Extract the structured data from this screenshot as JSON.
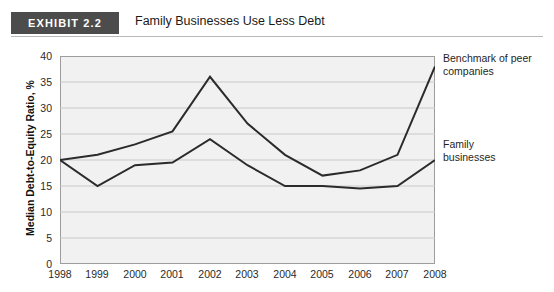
{
  "header": {
    "badge": "EXHIBIT 2.2",
    "title": "Family Businesses Use Less Debt"
  },
  "colors": {
    "badge_background": "#4c4c4c",
    "plot_background": "#f1f1f1",
    "gridline": "#c9c9c9",
    "axis": "#9c9c9c",
    "benchmark_line": "#2b2b2b",
    "family_line": "#2b2b2b"
  },
  "chart_data": {
    "type": "line",
    "title": "Family Businesses Use Less Debt",
    "xlabel": "",
    "ylabel": "Median Debt-to-Equity Ratio, %",
    "x": [
      1998,
      1999,
      2000,
      2001,
      2002,
      2003,
      2004,
      2005,
      2006,
      2007,
      2008
    ],
    "xtick_labels": [
      "1998",
      "1999",
      "2000",
      "2001",
      "2002",
      "2003",
      "2004",
      "2005",
      "2006",
      "2007",
      "2008"
    ],
    "ytick_labels": [
      "0",
      "5",
      "10",
      "15",
      "20",
      "25",
      "30",
      "35",
      "40"
    ],
    "yticks": [
      0,
      5,
      10,
      15,
      20,
      25,
      30,
      35,
      40
    ],
    "ylim": [
      0,
      40
    ],
    "grid": true,
    "legend_position": "right-annotations",
    "series": [
      {
        "name": "Benchmark of peer companies",
        "values": [
          20,
          21,
          23,
          25.5,
          36,
          27,
          21,
          17,
          18,
          21,
          38
        ],
        "annotation": "Benchmark of peer\ncompanies"
      },
      {
        "name": "Family businesses",
        "values": [
          20,
          15,
          19,
          19.5,
          24,
          19,
          15,
          15,
          14.5,
          15,
          20
        ],
        "annotation": "Family\nbusinesses"
      }
    ]
  },
  "annotations": {
    "benchmark_line1": "Benchmark of peer",
    "benchmark_line2": "companies",
    "family_line1": "Family",
    "family_line2": "businesses"
  }
}
